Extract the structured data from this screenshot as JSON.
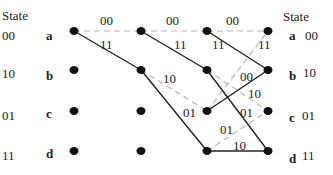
{
  "diagram": {
    "type": "trellis",
    "left_header": "State",
    "right_header": "State",
    "states": [
      {
        "letter": "a",
        "code": "00"
      },
      {
        "letter": "b",
        "code": "10"
      },
      {
        "letter": "c",
        "code": "01"
      },
      {
        "letter": "d",
        "code": "11"
      }
    ],
    "columns_x": [
      74,
      141,
      207,
      268
    ],
    "rows_y": [
      31,
      70,
      111,
      151
    ],
    "edges": [
      {
        "from": [
          0,
          0
        ],
        "to": [
          1,
          0
        ],
        "style": "dashed",
        "label": "00",
        "lx": 100,
        "ly": 25
      },
      {
        "from": [
          0,
          0
        ],
        "to": [
          1,
          1
        ],
        "style": "solid",
        "label": "11",
        "lx": 100,
        "ly": 49
      },
      {
        "from": [
          1,
          0
        ],
        "to": [
          2,
          0
        ],
        "style": "dashed",
        "label": "00",
        "lx": 166,
        "ly": 25
      },
      {
        "from": [
          1,
          0
        ],
        "to": [
          2,
          1
        ],
        "style": "solid",
        "label": "11",
        "lx": 174,
        "ly": 49
      },
      {
        "from": [
          1,
          1
        ],
        "to": [
          2,
          2
        ],
        "style": "dashed",
        "label": "10",
        "lx": 163,
        "ly": 83
      },
      {
        "from": [
          1,
          1
        ],
        "to": [
          2,
          3
        ],
        "style": "solid",
        "label": "01",
        "lx": 183,
        "ly": 117
      },
      {
        "from": [
          2,
          0
        ],
        "to": [
          3,
          0
        ],
        "style": "dashed",
        "label": "00",
        "lx": 226,
        "ly": 25
      },
      {
        "from": [
          2,
          0
        ],
        "to": [
          3,
          1
        ],
        "style": "solid",
        "label": "11",
        "lx": 212,
        "ly": 49
      },
      {
        "from": [
          2,
          1
        ],
        "to": [
          3,
          2
        ],
        "style": "dashed",
        "label": "10",
        "lx": 248,
        "ly": 98
      },
      {
        "from": [
          2,
          1
        ],
        "to": [
          3,
          3
        ],
        "style": "solid",
        "label": "01",
        "lx": 240,
        "ly": 117
      },
      {
        "from": [
          2,
          2
        ],
        "to": [
          3,
          0
        ],
        "style": "dashed",
        "label": "11",
        "lx": 258,
        "ly": 49
      },
      {
        "from": [
          2,
          2
        ],
        "to": [
          3,
          1
        ],
        "style": "solid",
        "label": "00",
        "lx": 240,
        "ly": 81
      },
      {
        "from": [
          2,
          3
        ],
        "to": [
          3,
          2
        ],
        "style": "dashed",
        "label": "01",
        "lx": 220,
        "ly": 134
      },
      {
        "from": [
          2,
          3
        ],
        "to": [
          3,
          3
        ],
        "style": "solid",
        "label": "10",
        "lx": 233,
        "ly": 150
      }
    ]
  }
}
